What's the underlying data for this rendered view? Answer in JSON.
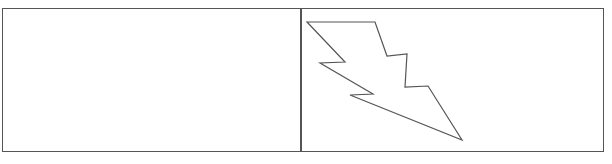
{
  "figure": {
    "title": "",
    "width": 612,
    "height": 164,
    "background_color": "#ffffff",
    "stroke_color": "#555555",
    "frame_stroke_width": 1.4,
    "divider_stroke_width": 1.4,
    "bolt_stroke_width": 1.2
  },
  "frame": {
    "name": "outer-rectangle",
    "x": 3,
    "y": 9,
    "width": 600,
    "height": 142,
    "fill": "#ffffff",
    "stroke": "#555555"
  },
  "divider": {
    "name": "vertical-divider",
    "x": 301,
    "y_top": 9,
    "y_bottom": 151,
    "stroke": "#555555"
  },
  "panels": [
    {
      "name": "left-panel",
      "label": "",
      "x": 3,
      "y": 9,
      "width": 298,
      "height": 142,
      "contents": "empty"
    },
    {
      "name": "right-panel",
      "label": "",
      "x": 301,
      "y": 9,
      "width": 302,
      "height": 142,
      "contents": "lightning-bolt"
    }
  ],
  "bolt": {
    "name": "lightning-bolt",
    "stroke": "#555555",
    "fill": "none",
    "points": "307,22 375,22 387,56 407,54 405,87 428,86 462,140 350,95 373,94 320,63 345,62",
    "vertices": [
      {
        "x": 307,
        "y": 22
      },
      {
        "x": 375,
        "y": 22
      },
      {
        "x": 387,
        "y": 56
      },
      {
        "x": 407,
        "y": 54
      },
      {
        "x": 405,
        "y": 87
      },
      {
        "x": 428,
        "y": 86
      },
      {
        "x": 462,
        "y": 140
      },
      {
        "x": 350,
        "y": 95
      },
      {
        "x": 373,
        "y": 94
      },
      {
        "x": 320,
        "y": 63
      },
      {
        "x": 345,
        "y": 62
      }
    ]
  }
}
